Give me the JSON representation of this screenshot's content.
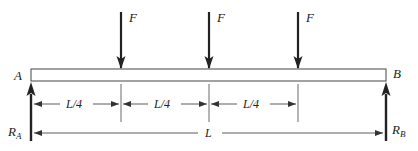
{
  "diagram": {
    "type": "simply-supported-beam",
    "beam": {
      "left_end_label": "A",
      "right_end_label": "B"
    },
    "loads": [
      {
        "label": "F",
        "position": "L/4"
      },
      {
        "label": "F",
        "position": "L/2"
      },
      {
        "label": "F",
        "position": "3L/4"
      }
    ],
    "reactions": [
      {
        "label": "R",
        "subscript": "A"
      },
      {
        "label": "R",
        "subscript": "B"
      }
    ],
    "dimensions": {
      "segments": [
        "L/4",
        "L/4",
        "L/4"
      ],
      "total": "L"
    },
    "colors": {
      "line": "#333333",
      "arrow": "#222222",
      "background": "#ffffff"
    }
  }
}
